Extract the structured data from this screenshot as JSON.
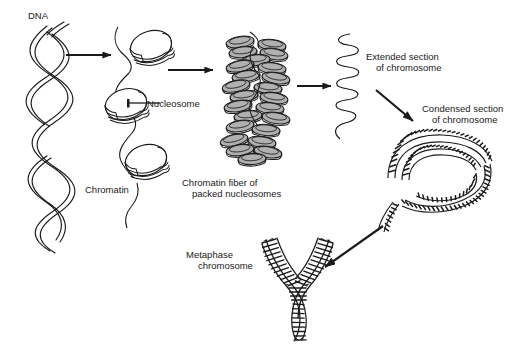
{
  "figure": {
    "background_color": "#ffffff",
    "ink_color": "#1a1a1a",
    "disc_fill_color": "#b0b0b0",
    "width": 515,
    "height": 347
  },
  "labels": {
    "dna": "DNA",
    "nucleosome": "Nucleosome",
    "chromatin": "Chromatin",
    "chromatin_fiber_line1": "Chromatin fiber of",
    "chromatin_fiber_line2": "packed nucleosomes",
    "extended_line1": "Extended section",
    "extended_line2": "of chromosome",
    "condensed_line1": "Condensed section",
    "condensed_line2": "of chromosome",
    "metaphase_line1": "Metaphase",
    "metaphase_line2": "chromosome"
  },
  "stages": [
    {
      "id": "dna-double-helix",
      "label": "DNA"
    },
    {
      "id": "nucleosome-beads",
      "label": "Nucleosome"
    },
    {
      "id": "chromatin-strand",
      "label": "Chromatin"
    },
    {
      "id": "chromatin-fiber",
      "label": "Chromatin fiber of packed nucleosomes"
    },
    {
      "id": "extended-section",
      "label": "Extended section of chromosome"
    },
    {
      "id": "condensed-section",
      "label": "Condensed section of chromosome"
    },
    {
      "id": "metaphase-chromosome",
      "label": "Metaphase chromosome"
    }
  ],
  "arrows": [
    {
      "id": "arrow-dna-to-nucleosome",
      "direction": "right"
    },
    {
      "id": "arrow-nucleosome-to-fiber",
      "direction": "right"
    },
    {
      "id": "arrow-fiber-to-extended",
      "direction": "right"
    },
    {
      "id": "arrow-extended-to-condensed",
      "direction": "down-right"
    },
    {
      "id": "arrow-condensed-to-metaphase",
      "direction": "down-left"
    }
  ]
}
